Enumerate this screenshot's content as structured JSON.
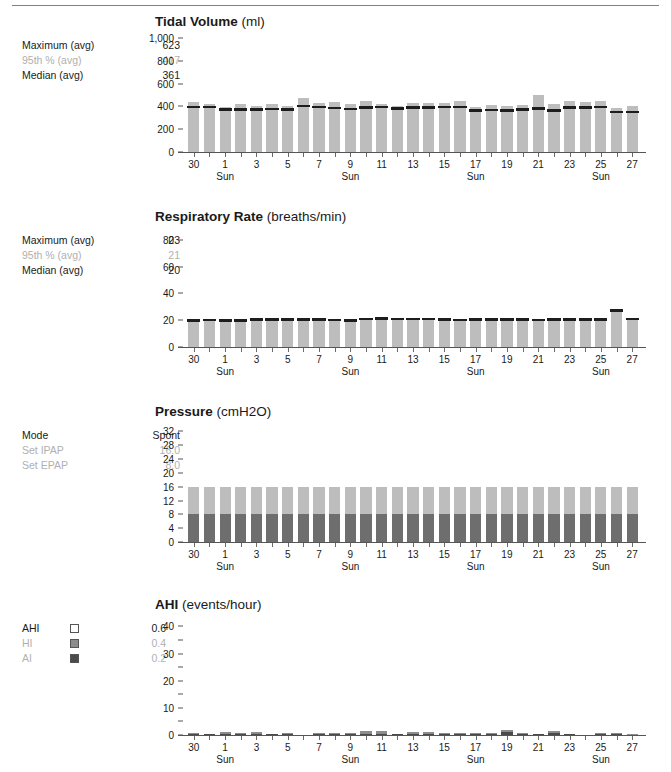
{
  "report": {
    "title": "Therapy Detail Report"
  },
  "panels": [
    {
      "id": "tidal-volume",
      "title": "Tidal Volume",
      "unit": "(ml)",
      "stats": [
        {
          "label": "Maximum (avg)",
          "value": "623",
          "dim": false
        },
        {
          "label": "95th % (avg)",
          "value": "417",
          "dim": true
        },
        {
          "label": "Median (avg)",
          "value": "361",
          "dim": false
        }
      ]
    },
    {
      "id": "respiratory-rate",
      "title": "Respiratory Rate",
      "unit": "(breaths/min)",
      "stats": [
        {
          "label": "Maximum (avg)",
          "value": "23",
          "dim": false
        },
        {
          "label": "95th % (avg)",
          "value": "21",
          "dim": true
        },
        {
          "label": "Median (avg)",
          "value": "20",
          "dim": false
        }
      ]
    },
    {
      "id": "pressure",
      "title": "Pressure",
      "unit": "(cmH2O)",
      "stats": [
        {
          "label": "Mode",
          "value": "Spont",
          "dim": false
        },
        {
          "label": "Set IPAP",
          "value": "16.0",
          "dim": true
        },
        {
          "label": "Set EPAP",
          "value": "8.0",
          "dim": true
        }
      ]
    },
    {
      "id": "ahi",
      "title": "AHI",
      "unit": "(events/hour)",
      "legend": [
        {
          "label": "AHI",
          "value": "0.6",
          "swatch": "#ffffff",
          "dim": false
        },
        {
          "label": "HI",
          "value": "0.4",
          "swatch": "#8c8c8c",
          "dim": true
        },
        {
          "label": "AI",
          "value": "0.2",
          "swatch": "#4a4a4a",
          "dim": true
        }
      ]
    }
  ],
  "colors": {
    "bar_light": "#bdbdbd",
    "bar_mid": "#8c8c8c",
    "bar_dark": "#6e6e6e",
    "median": "#1d1d1d",
    "axis": "#555555",
    "text": "#1a1a1a",
    "dim_text": "#b0b0b0"
  },
  "x_axis": {
    "labels": [
      "30",
      "",
      "1",
      "",
      "3",
      "",
      "5",
      "",
      "7",
      "",
      "9",
      "",
      "11",
      "",
      "13",
      "",
      "15",
      "",
      "17",
      "",
      "19",
      "",
      "21",
      "",
      "23",
      "",
      "25",
      "",
      "27"
    ],
    "tick_days": [
      "30",
      "31",
      "1",
      "2",
      "3",
      "4",
      "5",
      "6",
      "7",
      "8",
      "9",
      "10",
      "11",
      "12",
      "13",
      "14",
      "15",
      "16",
      "17",
      "18",
      "19",
      "20",
      "21",
      "22",
      "23",
      "24",
      "25",
      "26",
      "27"
    ],
    "sundays": [
      2,
      10,
      18,
      26
    ],
    "sunday_label": "Sun"
  },
  "chart_data": [
    {
      "type": "bar",
      "id": "tidal-volume",
      "title": "Tidal Volume (ml)",
      "xlabel": "",
      "ylabel": "ml",
      "ylim": [
        0,
        1000
      ],
      "yticks": [
        0,
        200,
        400,
        600,
        800,
        1000
      ],
      "ytick_labels": [
        "0",
        "200",
        "400",
        "600",
        "800",
        "1,000"
      ],
      "grid": false,
      "legend_position": "left",
      "categories": [
        "30",
        "31",
        "1",
        "2",
        "3",
        "4",
        "5",
        "6",
        "7",
        "8",
        "9",
        "10",
        "11",
        "12",
        "13",
        "14",
        "15",
        "16",
        "17",
        "18",
        "19",
        "20",
        "21",
        "22",
        "23",
        "24",
        "25",
        "26",
        "27"
      ],
      "series": [
        {
          "name": "95th percentile",
          "values": [
            440,
            420,
            395,
            425,
            400,
            418,
            400,
            478,
            430,
            440,
            420,
            450,
            425,
            408,
            430,
            428,
            430,
            448,
            395,
            412,
            400,
            410,
            500,
            418,
            445,
            438,
            450,
            390,
            405
          ]
        },
        {
          "name": "Median",
          "values": [
            382,
            382,
            363,
            362,
            363,
            365,
            362,
            392,
            382,
            375,
            368,
            378,
            385,
            372,
            378,
            380,
            382,
            385,
            352,
            356,
            352,
            360,
            372,
            352,
            378,
            378,
            382,
            338,
            338
          ]
        }
      ]
    },
    {
      "type": "bar",
      "id": "respiratory-rate",
      "title": "Respiratory Rate (breaths/min)",
      "xlabel": "",
      "ylabel": "breaths/min",
      "ylim": [
        0,
        85
      ],
      "yticks": [
        0,
        20,
        40,
        60,
        80
      ],
      "ytick_labels": [
        "0",
        "20",
        "40",
        "60",
        "80"
      ],
      "grid": false,
      "legend_position": "left",
      "categories": [
        "30",
        "31",
        "1",
        "2",
        "3",
        "4",
        "5",
        "6",
        "7",
        "8",
        "9",
        "10",
        "11",
        "12",
        "13",
        "14",
        "15",
        "16",
        "17",
        "18",
        "19",
        "20",
        "21",
        "22",
        "23",
        "24",
        "25",
        "26",
        "27"
      ],
      "series": [
        {
          "name": "95th percentile",
          "values": [
            20.0,
            20.0,
            19.7,
            20.0,
            20.3,
            20.4,
            20.5,
            20.6,
            20.4,
            20.1,
            19.8,
            20.6,
            21.0,
            20.8,
            20.6,
            20.6,
            20.4,
            20.0,
            20.2,
            20.4,
            20.4,
            20.3,
            20.1,
            20.3,
            20.2,
            20.2,
            20.4,
            27.0,
            20.8
          ]
        },
        {
          "name": "Median",
          "values": [
            19.0,
            19.2,
            18.8,
            19.0,
            19.4,
            19.5,
            19.6,
            19.7,
            19.5,
            19.2,
            18.9,
            19.8,
            20.2,
            20.0,
            19.8,
            19.8,
            19.6,
            19.2,
            19.5,
            19.6,
            19.6,
            19.5,
            19.3,
            19.5,
            19.4,
            19.4,
            19.6,
            26.2,
            20.0
          ]
        }
      ]
    },
    {
      "type": "bar",
      "id": "pressure",
      "title": "Pressure (cmH2O)",
      "xlabel": "",
      "ylabel": "cmH2O",
      "ylim": [
        0,
        33
      ],
      "yticks": [
        0,
        4,
        8,
        12,
        16,
        20,
        24,
        28,
        32
      ],
      "ytick_labels": [
        "0",
        "4",
        "8",
        "12",
        "16",
        "20",
        "24",
        "28",
        "32"
      ],
      "grid": false,
      "legend_position": "left",
      "categories": [
        "30",
        "31",
        "1",
        "2",
        "3",
        "4",
        "5",
        "6",
        "7",
        "8",
        "9",
        "10",
        "11",
        "12",
        "13",
        "14",
        "15",
        "16",
        "17",
        "18",
        "19",
        "20",
        "21",
        "22",
        "23",
        "24",
        "25",
        "26",
        "27"
      ],
      "series": [
        {
          "name": "IPAP",
          "values": [
            16.0,
            16.0,
            16.0,
            16.0,
            16.0,
            16.0,
            16.0,
            16.0,
            16.0,
            16.0,
            16.0,
            16.0,
            16.0,
            16.0,
            16.0,
            16.0,
            16.0,
            16.0,
            16.0,
            16.0,
            16.0,
            16.0,
            16.0,
            16.0,
            16.0,
            16.0,
            16.0,
            16.0,
            16.0
          ]
        },
        {
          "name": "EPAP",
          "values": [
            8.0,
            8.0,
            8.0,
            8.0,
            8.0,
            8.0,
            8.0,
            8.0,
            8.0,
            8.0,
            8.0,
            8.0,
            8.0,
            8.0,
            8.0,
            8.0,
            8.0,
            8.0,
            8.0,
            8.0,
            8.0,
            8.0,
            8.0,
            8.0,
            8.0,
            8.0,
            8.0,
            8.0,
            8.0
          ]
        }
      ]
    },
    {
      "type": "bar",
      "id": "ahi",
      "title": "AHI (events/hour)",
      "xlabel": "",
      "ylabel": "events/hour",
      "ylim": [
        0,
        42
      ],
      "yticks": [
        0,
        5,
        10,
        15,
        20,
        25,
        30,
        35,
        40
      ],
      "ytick_labels": [
        "0",
        "",
        "10",
        "",
        "20",
        "",
        "30",
        "",
        "40"
      ],
      "grid": false,
      "legend_position": "left",
      "categories": [
        "30",
        "31",
        "1",
        "2",
        "3",
        "4",
        "5",
        "6",
        "7",
        "8",
        "9",
        "10",
        "11",
        "12",
        "13",
        "14",
        "15",
        "16",
        "17",
        "18",
        "19",
        "20",
        "21",
        "22",
        "23",
        "24",
        "25",
        "26",
        "27"
      ],
      "series": [
        {
          "name": "AI",
          "values": [
            0.2,
            0.1,
            0.5,
            0.2,
            0.5,
            0.1,
            0.3,
            0.0,
            0.2,
            0.2,
            0.2,
            0.5,
            0.4,
            0.1,
            0.4,
            0.3,
            0.2,
            0.2,
            0.3,
            0.2,
            1.0,
            0.4,
            0.1,
            0.7,
            0.1,
            0.0,
            0.3,
            0.3,
            0.0
          ]
        },
        {
          "name": "HI",
          "values": [
            0.4,
            0.3,
            0.5,
            0.5,
            0.7,
            0.2,
            0.6,
            0.0,
            0.4,
            0.5,
            0.3,
            0.9,
            1.0,
            0.3,
            0.6,
            0.8,
            0.3,
            0.4,
            0.6,
            0.4,
            0.8,
            0.3,
            0.2,
            0.8,
            0.2,
            0.0,
            0.4,
            0.5,
            0.1
          ]
        }
      ]
    }
  ]
}
